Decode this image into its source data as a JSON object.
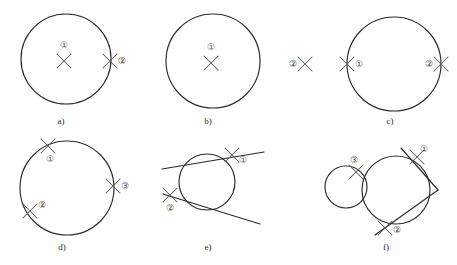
{
  "figure": {
    "title": "",
    "background_color": "#ffffff",
    "ink_color": "#2a2a2a",
    "mark_color": "#5a5a5a",
    "width": 457,
    "height": 265,
    "panels": [
      {
        "id": "a",
        "caption": "a)",
        "caption_x": 61,
        "caption_y": 124,
        "circles": [
          {
            "name": "main-circle",
            "cx": 66,
            "cy": 59,
            "r": 45
          }
        ],
        "lines": [],
        "marks": [
          {
            "name": "mark-1",
            "label": "①",
            "x": 64,
            "y": 61,
            "label_x": 64,
            "label_y": 48,
            "size": 7
          },
          {
            "name": "mark-2",
            "label": "②",
            "x": 110,
            "y": 61,
            "label_x": 122,
            "label_y": 64,
            "size": 7
          }
        ]
      },
      {
        "id": "b",
        "caption": "b)",
        "caption_x": 208,
        "caption_y": 124,
        "circles": [
          {
            "name": "main-circle",
            "cx": 213,
            "cy": 61,
            "r": 47
          }
        ],
        "lines": [],
        "marks": [
          {
            "name": "mark-1",
            "label": "①",
            "x": 211,
            "y": 63,
            "label_x": 211,
            "label_y": 50,
            "size": 7
          },
          {
            "name": "mark-2",
            "label": "②",
            "x": 305,
            "y": 64,
            "label_x": 293,
            "label_y": 67,
            "size": 7
          }
        ]
      },
      {
        "id": "c",
        "caption": "c)",
        "caption_x": 390,
        "caption_y": 124,
        "circles": [
          {
            "name": "main-circle",
            "cx": 394,
            "cy": 64,
            "r": 47
          }
        ],
        "lines": [],
        "marks": [
          {
            "name": "mark-1",
            "label": "①",
            "x": 347,
            "y": 64,
            "label_x": 359,
            "label_y": 67,
            "size": 7
          },
          {
            "name": "mark-2",
            "label": "②",
            "x": 441,
            "y": 64,
            "label_x": 429,
            "label_y": 67,
            "size": 7
          }
        ]
      },
      {
        "id": "d",
        "caption": "d)",
        "caption_x": 62,
        "caption_y": 250,
        "circles": [
          {
            "name": "main-circle",
            "cx": 67,
            "cy": 188,
            "r": 47
          }
        ],
        "lines": [],
        "marks": [
          {
            "name": "mark-1",
            "label": "①",
            "x": 48,
            "y": 146,
            "label_x": 50,
            "label_y": 162,
            "size": 7
          },
          {
            "name": "mark-2",
            "label": "②",
            "x": 30,
            "y": 211,
            "label_x": 42,
            "label_y": 208,
            "size": 7
          },
          {
            "name": "mark-3",
            "label": "③",
            "x": 113,
            "y": 186,
            "label_x": 125,
            "label_y": 189,
            "size": 7
          }
        ]
      },
      {
        "id": "e",
        "caption": "e)",
        "caption_x": 208,
        "caption_y": 250,
        "circles": [
          {
            "name": "main-circle",
            "cx": 207,
            "cy": 182,
            "r": 28
          }
        ],
        "lines": [
          {
            "name": "upper-tangent-line",
            "x1": 162,
            "y1": 169,
            "x2": 264,
            "y2": 152
          },
          {
            "name": "lower-tangent-line",
            "x1": 163,
            "y1": 194,
            "x2": 260,
            "y2": 224
          }
        ],
        "marks": [
          {
            "name": "mark-1",
            "label": "①",
            "x": 232,
            "y": 155,
            "label_x": 243,
            "label_y": 163,
            "size": 7
          },
          {
            "name": "mark-2",
            "label": "②",
            "x": 170,
            "y": 195,
            "label_x": 170,
            "label_y": 211,
            "size": 7
          }
        ]
      },
      {
        "id": "f",
        "caption": "f)",
        "caption_x": 386,
        "caption_y": 250,
        "circles": [
          {
            "name": "small-circle",
            "cx": 346,
            "cy": 187,
            "r": 21
          },
          {
            "name": "large-circle",
            "cx": 396,
            "cy": 190,
            "r": 34
          }
        ],
        "lines": [
          {
            "name": "upper-tangent-line",
            "x1": 401,
            "y1": 148,
            "x2": 438,
            "y2": 190
          },
          {
            "name": "lower-tangent-line",
            "x1": 375,
            "y1": 235,
            "x2": 438,
            "y2": 190
          }
        ],
        "marks": [
          {
            "name": "mark-1",
            "label": "①",
            "x": 417,
            "y": 157,
            "label_x": 424,
            "label_y": 152,
            "size": 7
          },
          {
            "name": "mark-2",
            "label": "②",
            "x": 385,
            "y": 228,
            "label_x": 397,
            "label_y": 233,
            "size": 7
          },
          {
            "name": "mark-3",
            "label": "③",
            "x": 356,
            "y": 172,
            "label_x": 354,
            "label_y": 163,
            "size": 7
          }
        ]
      }
    ]
  }
}
